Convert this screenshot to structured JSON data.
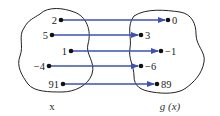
{
  "diagram": {
    "type": "function-mapping",
    "domain_label": "x",
    "range_label": "g (x)",
    "arrow_color": "#3a52b8",
    "mappings": [
      {
        "input": "2",
        "output": "0",
        "in_pos": [
          61,
          20
        ],
        "out_pos": [
          168,
          20
        ]
      },
      {
        "input": "5",
        "output": "3",
        "in_pos": [
          52,
          35
        ],
        "out_pos": [
          141,
          35
        ]
      },
      {
        "input": "1",
        "output": "−1",
        "in_pos": [
          71,
          51
        ],
        "out_pos": [
          161,
          51
        ]
      },
      {
        "input": "−4",
        "output": "−6",
        "in_pos": [
          49,
          66
        ],
        "out_pos": [
          141,
          66
        ]
      },
      {
        "input": "91",
        "output": "89",
        "in_pos": [
          63,
          84
        ],
        "out_pos": [
          157,
          84
        ]
      }
    ]
  }
}
